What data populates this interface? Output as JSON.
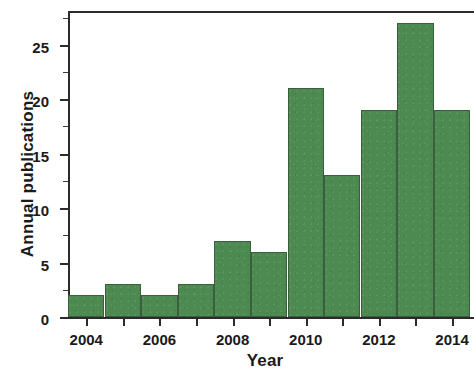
{
  "chart_data": {
    "type": "bar",
    "title": "",
    "xlabel": "Year",
    "ylabel": "Annual publications",
    "categories": [
      "2004",
      "2005",
      "2006",
      "2007",
      "2008",
      "2009",
      "2010",
      "2011",
      "2012",
      "2013",
      "2014"
    ],
    "values": [
      2,
      3,
      2,
      3,
      7,
      6,
      21,
      13,
      19,
      27,
      19
    ],
    "xtick_labels": [
      "2004",
      "2006",
      "2008",
      "2010",
      "2012",
      "2014"
    ],
    "ytick_labels": [
      "0",
      "5",
      "10",
      "15",
      "20",
      "25"
    ],
    "ytick_values": [
      0,
      5,
      10,
      15,
      20,
      25
    ],
    "yminor_values": [
      2.5,
      7.5,
      12.5,
      17.5,
      22.5,
      27.5
    ],
    "xlim": [
      2003.5,
      2014.6
    ],
    "ylim": [
      0,
      28.1
    ],
    "grid": false,
    "legend": null,
    "bar_color": "#4d8a51",
    "bar_edge_color": "#3b5f3c",
    "axis_color": "#2b2b2b",
    "note": "Rightmost bar (2014) is clipped by the figure edge"
  }
}
